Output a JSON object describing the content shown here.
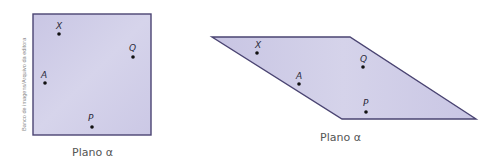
{
  "figure": {
    "credit": "Banco de imagens/Arquivo da editora",
    "colors": {
      "plane_fill": "#cdcae6",
      "plane_stroke": "#4a4472",
      "point": "#111111",
      "label": "#2a2a3a",
      "caption": "#555555",
      "credit": "#8a8a8a"
    },
    "square_view": {
      "caption": "Plano α",
      "points": [
        {
          "name": "X",
          "label": "X"
        },
        {
          "name": "Q",
          "label": "Q"
        },
        {
          "name": "A",
          "label": "A"
        },
        {
          "name": "P",
          "label": "P"
        }
      ]
    },
    "perspective_view": {
      "caption": "Plano α",
      "points": [
        {
          "name": "X",
          "label": "X"
        },
        {
          "name": "A",
          "label": "A"
        },
        {
          "name": "Q",
          "label": "Q"
        },
        {
          "name": "P",
          "label": "P"
        }
      ]
    }
  }
}
